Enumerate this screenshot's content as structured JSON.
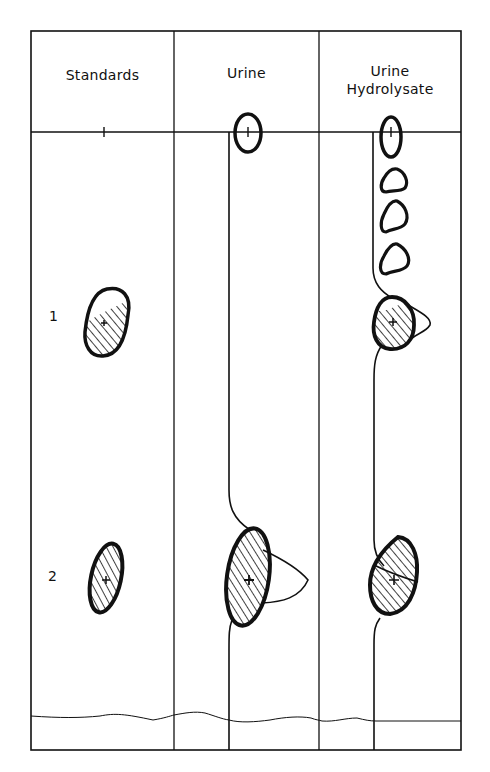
{
  "diagram": {
    "type": "paper chromatogram",
    "columns": [
      {
        "id": "standards",
        "header_line1": "Standards",
        "header_line2": ""
      },
      {
        "id": "urine",
        "header_line1": "Urine",
        "header_line2": ""
      },
      {
        "id": "hydrolysate",
        "header_line1": "Urine",
        "header_line2": "Hydrolysate"
      }
    ],
    "spot_labels": [
      {
        "id": "1",
        "text": "1"
      },
      {
        "id": "2",
        "text": "2"
      }
    ],
    "colors": {
      "ink": "#111111",
      "background": "#ffffff"
    }
  }
}
